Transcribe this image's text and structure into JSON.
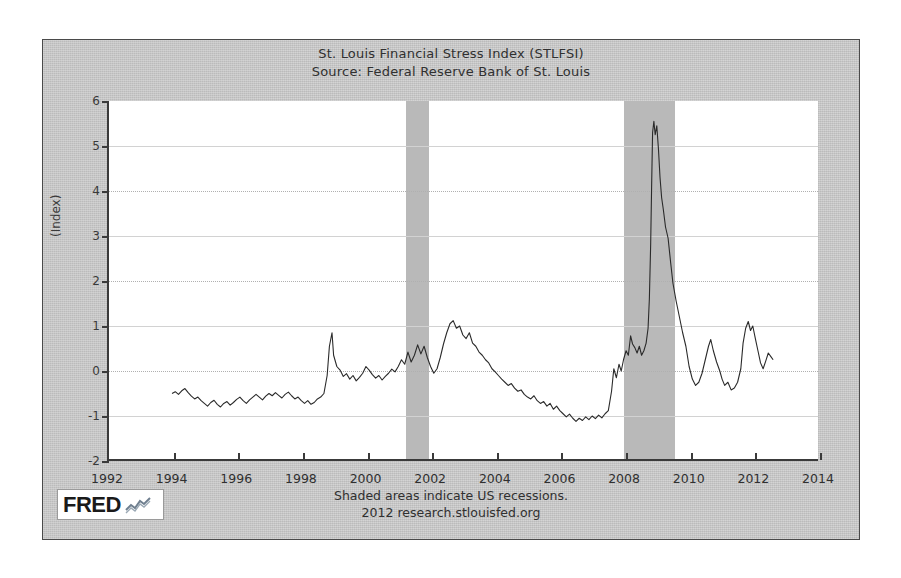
{
  "chart_title": {
    "line1": "St. Louis Financial Stress Index (STLFSI)",
    "line2": "Source: Federal Reserve Bank of St. Louis"
  },
  "footer": {
    "line1": "Shaded areas indicate US recessions.",
    "line2": "2012 research.stlouisfed.org"
  },
  "logo": {
    "text": "FRED",
    "mark": "line-chart-icon"
  },
  "colors": {
    "panel_background": "#c9c9c9",
    "plot_background": "#ffffff",
    "series_line": "#2a2a2a",
    "recession_band": "#b9b9b9",
    "axis": "#3a3a3a",
    "gridline": "#b0b0b0"
  },
  "chart_data": {
    "type": "line",
    "title": "St. Louis Financial Stress Index (STLFSI)",
    "subtitle": "Source: Federal Reserve Bank of St. Louis",
    "xlabel": "",
    "ylabel": "(Index)",
    "xlim": [
      1992,
      2014
    ],
    "ylim": [
      -2,
      6
    ],
    "xticks": [
      1992,
      1994,
      1996,
      1998,
      2000,
      2002,
      2004,
      2006,
      2008,
      2010,
      2012,
      2014
    ],
    "yticks": [
      -2,
      -1,
      0,
      1,
      2,
      3,
      4,
      5,
      6
    ],
    "grid": true,
    "legend": null,
    "annotations": [
      "Shaded areas indicate US recessions."
    ],
    "shaded_regions": [
      {
        "label": "2001 recession",
        "x_start": 2001.2,
        "x_end": 2001.9
      },
      {
        "label": "2007-2009 recession",
        "x_start": 2007.95,
        "x_end": 2009.5
      }
    ],
    "series": [
      {
        "name": "STLFSI",
        "units": "Index",
        "x": [
          1993.95,
          1994.05,
          1994.15,
          1994.25,
          1994.35,
          1994.45,
          1994.55,
          1994.65,
          1994.75,
          1994.85,
          1994.95,
          1995.05,
          1995.15,
          1995.25,
          1995.35,
          1995.45,
          1995.55,
          1995.65,
          1995.75,
          1995.85,
          1995.95,
          1996.05,
          1996.15,
          1996.25,
          1996.35,
          1996.45,
          1996.55,
          1996.65,
          1996.75,
          1996.85,
          1996.95,
          1997.05,
          1997.15,
          1997.25,
          1997.35,
          1997.45,
          1997.55,
          1997.65,
          1997.75,
          1997.85,
          1997.95,
          1998.05,
          1998.15,
          1998.25,
          1998.35,
          1998.45,
          1998.55,
          1998.65,
          1998.75,
          1998.82,
          1998.9,
          1998.95,
          1999.05,
          1999.15,
          1999.25,
          1999.35,
          1999.45,
          1999.55,
          1999.65,
          1999.75,
          1999.85,
          1999.95,
          2000.05,
          2000.15,
          2000.25,
          2000.35,
          2000.45,
          2000.55,
          2000.65,
          2000.75,
          2000.85,
          2000.95,
          2001.05,
          2001.15,
          2001.25,
          2001.35,
          2001.45,
          2001.55,
          2001.65,
          2001.75,
          2001.85,
          2001.95,
          2002.05,
          2002.15,
          2002.25,
          2002.35,
          2002.45,
          2002.55,
          2002.65,
          2002.75,
          2002.85,
          2002.95,
          2003.05,
          2003.15,
          2003.25,
          2003.35,
          2003.45,
          2003.55,
          2003.65,
          2003.75,
          2003.85,
          2003.95,
          2004.05,
          2004.15,
          2004.25,
          2004.35,
          2004.45,
          2004.55,
          2004.65,
          2004.75,
          2004.85,
          2004.95,
          2005.05,
          2005.15,
          2005.25,
          2005.35,
          2005.45,
          2005.55,
          2005.65,
          2005.75,
          2005.85,
          2005.95,
          2006.05,
          2006.15,
          2006.25,
          2006.35,
          2006.45,
          2006.55,
          2006.65,
          2006.75,
          2006.85,
          2006.95,
          2007.05,
          2007.15,
          2007.25,
          2007.35,
          2007.45,
          2007.55,
          2007.62,
          2007.7,
          2007.78,
          2007.85,
          2007.92,
          2008.0,
          2008.07,
          2008.14,
          2008.2,
          2008.27,
          2008.34,
          2008.41,
          2008.48,
          2008.55,
          2008.62,
          2008.68,
          2008.72,
          2008.76,
          2008.79,
          2008.82,
          2008.86,
          2008.9,
          2008.95,
          2009.0,
          2009.05,
          2009.1,
          2009.15,
          2009.22,
          2009.3,
          2009.38,
          2009.45,
          2009.55,
          2009.65,
          2009.75,
          2009.85,
          2009.95,
          2010.05,
          2010.15,
          2010.25,
          2010.35,
          2010.45,
          2010.55,
          2010.62,
          2010.7,
          2010.8,
          2010.9,
          2010.97,
          2011.05,
          2011.15,
          2011.25,
          2011.35,
          2011.45,
          2011.55,
          2011.62,
          2011.7,
          2011.78,
          2011.85,
          2011.92,
          2012.0,
          2012.08,
          2012.16,
          2012.24,
          2012.32,
          2012.4,
          2012.48,
          2012.55
        ],
        "y": [
          -0.5,
          -0.46,
          -0.52,
          -0.44,
          -0.39,
          -0.48,
          -0.56,
          -0.62,
          -0.58,
          -0.66,
          -0.72,
          -0.78,
          -0.7,
          -0.65,
          -0.74,
          -0.8,
          -0.72,
          -0.68,
          -0.76,
          -0.7,
          -0.63,
          -0.58,
          -0.66,
          -0.72,
          -0.64,
          -0.58,
          -0.52,
          -0.58,
          -0.64,
          -0.56,
          -0.5,
          -0.55,
          -0.48,
          -0.54,
          -0.6,
          -0.52,
          -0.47,
          -0.55,
          -0.62,
          -0.58,
          -0.66,
          -0.72,
          -0.66,
          -0.74,
          -0.7,
          -0.62,
          -0.58,
          -0.5,
          -0.1,
          0.55,
          0.85,
          0.35,
          0.1,
          0.02,
          -0.12,
          -0.06,
          -0.18,
          -0.1,
          -0.22,
          -0.14,
          -0.05,
          0.1,
          0.02,
          -0.08,
          -0.16,
          -0.1,
          -0.2,
          -0.12,
          -0.05,
          0.04,
          -0.02,
          0.1,
          0.25,
          0.15,
          0.42,
          0.2,
          0.35,
          0.58,
          0.38,
          0.55,
          0.3,
          0.1,
          -0.05,
          0.05,
          0.3,
          0.6,
          0.85,
          1.05,
          1.12,
          0.95,
          1.0,
          0.8,
          0.72,
          0.85,
          0.62,
          0.55,
          0.42,
          0.35,
          0.25,
          0.18,
          0.05,
          -0.02,
          -0.1,
          -0.18,
          -0.25,
          -0.32,
          -0.28,
          -0.38,
          -0.45,
          -0.42,
          -0.52,
          -0.58,
          -0.62,
          -0.55,
          -0.66,
          -0.72,
          -0.68,
          -0.78,
          -0.72,
          -0.85,
          -0.78,
          -0.88,
          -0.95,
          -1.02,
          -0.96,
          -1.05,
          -1.12,
          -1.05,
          -1.1,
          -1.02,
          -1.08,
          -1.0,
          -1.06,
          -0.98,
          -1.04,
          -0.95,
          -0.88,
          -0.45,
          0.05,
          -0.15,
          0.15,
          0.0,
          0.25,
          0.45,
          0.35,
          0.78,
          0.6,
          0.52,
          0.4,
          0.55,
          0.35,
          0.45,
          0.62,
          0.95,
          1.6,
          2.8,
          4.1,
          5.3,
          5.55,
          5.25,
          5.45,
          4.95,
          4.3,
          3.85,
          3.6,
          3.2,
          2.95,
          2.4,
          1.95,
          1.55,
          1.2,
          0.85,
          0.55,
          0.1,
          -0.18,
          -0.32,
          -0.25,
          -0.05,
          0.25,
          0.55,
          0.7,
          0.45,
          0.2,
          0.0,
          -0.18,
          -0.32,
          -0.25,
          -0.42,
          -0.38,
          -0.25,
          0.05,
          0.62,
          0.95,
          1.1,
          0.9,
          1.0,
          0.72,
          0.45,
          0.18,
          0.05,
          0.22,
          0.4,
          0.32,
          0.25
        ]
      }
    ]
  }
}
